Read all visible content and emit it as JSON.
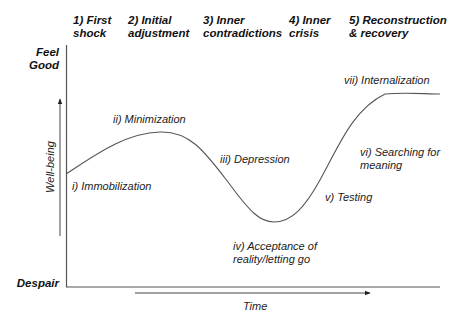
{
  "stages": [
    {
      "line1": "1) First",
      "line2": "shock"
    },
    {
      "line1": "2) Initial",
      "line2": "adjustment"
    },
    {
      "line1": "3) Inner",
      "line2": "contradictions"
    },
    {
      "line1": "4) Inner",
      "line2": "crisis"
    },
    {
      "line1": "5) Reconstruction",
      "line2": "& recovery"
    }
  ],
  "poles": {
    "top_line1": "Feel",
    "top_line2": "Good",
    "bottom": "Despair"
  },
  "axes": {
    "y_label": "Well-being",
    "x_label": "Time"
  },
  "phases": [
    {
      "id": "i",
      "line1": "i) Immobilization"
    },
    {
      "id": "ii",
      "line1": "ii) Minimization"
    },
    {
      "id": "iii",
      "line1": "iii) Depression"
    },
    {
      "id": "iv",
      "line1": "iv) Acceptance of",
      "line2": "reality/letting go"
    },
    {
      "id": "v",
      "line1": "v) Testing"
    },
    {
      "id": "vi",
      "line1": "vi) Searching for",
      "line2": "meaning"
    },
    {
      "id": "vii",
      "line1": "vii) Internalization"
    }
  ],
  "colors": {
    "line": "#555555",
    "text": "#111111"
  }
}
